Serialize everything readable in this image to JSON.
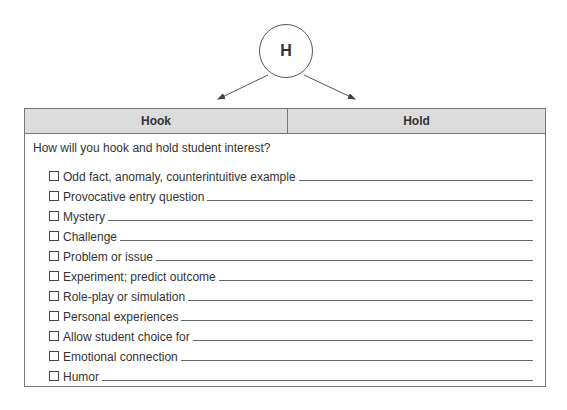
{
  "diagram": {
    "circle_letter": "H"
  },
  "table": {
    "headers": [
      "Hook",
      "Hold"
    ],
    "question": "How will you hook and hold student interest?",
    "items": [
      {
        "label": "Odd fact, anomaly, counterintuitive example",
        "checked": false
      },
      {
        "label": "Provocative entry question",
        "checked": false
      },
      {
        "label": "Mystery",
        "checked": false
      },
      {
        "label": "Challenge",
        "checked": false
      },
      {
        "label": "Problem or issue",
        "checked": false
      },
      {
        "label": "Experiment; predict outcome",
        "checked": false
      },
      {
        "label": "Role-play or simulation",
        "checked": false
      },
      {
        "label": "Personal experiences",
        "checked": false
      },
      {
        "label": "Allow student choice for",
        "checked": false
      },
      {
        "label": "Emotional connection",
        "checked": false
      },
      {
        "label": "Humor",
        "checked": false
      }
    ]
  },
  "colors": {
    "header_bg": "#dcdcdc",
    "border": "#777777",
    "text": "#333333"
  }
}
